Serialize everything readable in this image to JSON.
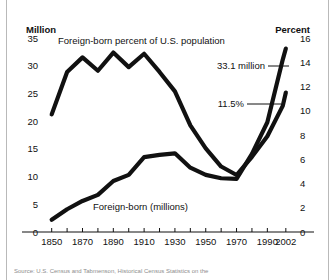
{
  "figure": {
    "background_color": "#ffffff",
    "ink_color": "#111111",
    "source_note": "Source: U.S. Census and Tabmenson, Historical Census Statistics on the"
  },
  "chart_data": {
    "type": "line",
    "title": "",
    "xlabel": "",
    "grid": false,
    "legend_position": "inline-annotations",
    "x": [
      1850,
      1860,
      1870,
      1880,
      1890,
      1900,
      1910,
      1920,
      1930,
      1940,
      1950,
      1960,
      1970,
      1980,
      1990,
      2000,
      2002
    ],
    "xlim": [
      1845,
      2006
    ],
    "x_tick_labels": [
      "1850",
      "1870",
      "1890",
      "1910",
      "1930",
      "1950",
      "1970",
      "1990",
      "2002"
    ],
    "x_tick_values": [
      1850,
      1870,
      1890,
      1910,
      1930,
      1950,
      1970,
      1990,
      2002
    ],
    "x_minor_tick_values": [
      1850,
      1860,
      1870,
      1880,
      1890,
      1900,
      1910,
      1920,
      1930,
      1940,
      1950,
      1960,
      1970,
      1980,
      1990,
      2002
    ],
    "left_axis": {
      "label": "Million",
      "ylim": [
        0,
        35
      ],
      "ticks": [
        0,
        5,
        10,
        15,
        20,
        25,
        30,
        35
      ],
      "tick_labels": [
        "0",
        "5",
        "10",
        "15",
        "20",
        "25",
        "30",
        "35"
      ]
    },
    "right_axis": {
      "label": "Percent",
      "ylim": [
        0,
        16
      ],
      "ticks": [
        0,
        2,
        4,
        6,
        8,
        10,
        12,
        14,
        16
      ],
      "tick_labels": [
        "0",
        "2",
        "4",
        "6",
        "8",
        "10",
        "12",
        "14",
        "16"
      ]
    },
    "series": [
      {
        "name": "Foreign-born percent of U.S. population",
        "axis": "right",
        "units": "percent",
        "label": "Foreign-born percent of U.S. population",
        "values": [
          9.7,
          13.2,
          14.4,
          13.3,
          14.8,
          13.6,
          14.7,
          13.2,
          11.6,
          8.8,
          6.9,
          5.4,
          4.7,
          6.2,
          7.9,
          10.4,
          11.5
        ]
      },
      {
        "name": "Foreign-born (millions)",
        "axis": "left",
        "units": "millions",
        "label": "Foreign-born (millions)",
        "values": [
          2.2,
          4.1,
          5.6,
          6.7,
          9.2,
          10.3,
          13.5,
          13.9,
          14.2,
          11.6,
          10.3,
          9.7,
          9.6,
          14.1,
          19.8,
          31.1,
          33.1
        ]
      }
    ],
    "annotations": [
      {
        "text": "33.1 million",
        "series": "Foreign-born (millions)",
        "at_x": 2002,
        "at_value": 33.1
      },
      {
        "text": "11.5%",
        "series": "Foreign-born percent of U.S. population",
        "at_x": 2002,
        "at_value": 11.5
      }
    ]
  }
}
